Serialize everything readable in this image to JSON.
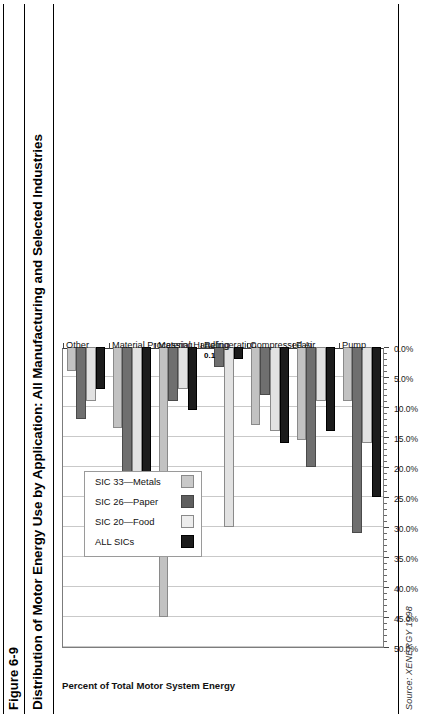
{
  "figure": {
    "number": "Figure 6-9",
    "title": "Distribution of Motor Energy Use by Application: All Manufacturing and Selected Industries",
    "source_prefix": "Source:",
    "source_name": "XENERGY 1998"
  },
  "legend": {
    "entries": [
      {
        "label": "ALL SICs",
        "color": "#1c1c1c"
      },
      {
        "label": "SIC 20—Food",
        "color": "#ededed"
      },
      {
        "label": "SIC 26—Paper",
        "color": "#5f5f5f"
      },
      {
        "label": "SIC 33—Metals",
        "color": "#c9c9c9"
      }
    ]
  },
  "chart_data": {
    "type": "bar",
    "orientation": "horizontal",
    "title": "Distribution of Motor Energy Use by Application: All Manufacturing and Selected Industries",
    "xlabel": "",
    "ylabel": "Percent of Total Motor System Energy",
    "categories": [
      "Pump",
      "Fan",
      "Compressed Air",
      "Refrigeration",
      "Material Handling",
      "Material Processing",
      "Other"
    ],
    "tick_labels": [
      "50.0%",
      "45.0%",
      "40.0%",
      "35.0%",
      "30.0%",
      "25.0%",
      "20.0%",
      "15.0%",
      "10.0%",
      "5.0%",
      "0.0%"
    ],
    "tick_values": [
      50,
      45,
      40,
      35,
      30,
      25,
      20,
      15,
      10,
      5,
      0
    ],
    "xlim": [
      0,
      50
    ],
    "grid": true,
    "legend_position": "inside-left",
    "series": [
      {
        "name": "ALL SICs",
        "color": "#1c1c1c",
        "values": [
          25.0,
          14.0,
          16.0,
          2.0,
          10.5,
          23.0,
          7.0
        ]
      },
      {
        "name": "SIC 20—Food",
        "color": "#ededed",
        "values": [
          16.0,
          9.0,
          14.0,
          30.0,
          7.0,
          25.5,
          9.0
        ]
      },
      {
        "name": "SIC 26—Paper",
        "color": "#5f5f5f",
        "values": [
          31.0,
          20.0,
          8.0,
          3.3,
          9.0,
          21.0,
          12.0
        ]
      },
      {
        "name": "SIC 33—Metals",
        "color": "#c9c9c9",
        "values": [
          9.0,
          15.5,
          13.0,
          0.1,
          45.0,
          13.5,
          4.0
        ]
      }
    ],
    "annotations": [
      {
        "text": "0.1",
        "category": "Refrigeration",
        "series": "SIC 33—Metals"
      }
    ]
  }
}
